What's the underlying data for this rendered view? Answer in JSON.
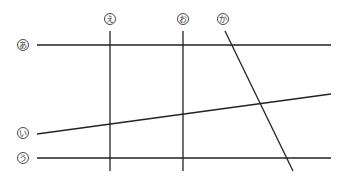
{
  "diagram": {
    "type": "line-intersection",
    "colors": {
      "line": "#222222",
      "label": "#333333",
      "background": "#ffffff"
    },
    "lines": [
      {
        "id": "a",
        "label": "あ",
        "orientation": "horizontal",
        "x1": 37,
        "y1": 45,
        "x2": 331,
        "y2": 45,
        "label_x": 23,
        "label_y": 45
      },
      {
        "id": "i",
        "label": "い",
        "orientation": "slanted",
        "x1": 37,
        "y1": 134,
        "x2": 331,
        "y2": 94,
        "label_x": 23,
        "label_y": 133
      },
      {
        "id": "u",
        "label": "う",
        "orientation": "horizontal",
        "x1": 37,
        "y1": 158,
        "x2": 331,
        "y2": 158,
        "label_x": 23,
        "label_y": 158
      },
      {
        "id": "e",
        "label": "え",
        "orientation": "vertical",
        "x1": 110,
        "y1": 31,
        "x2": 110,
        "y2": 171,
        "label_x": 110,
        "label_y": 19
      },
      {
        "id": "o",
        "label": "お",
        "orientation": "vertical",
        "x1": 183,
        "y1": 31,
        "x2": 183,
        "y2": 171,
        "label_x": 183,
        "label_y": 19
      },
      {
        "id": "ka",
        "label": "か",
        "orientation": "slanted",
        "x1": 225,
        "y1": 31,
        "x2": 293,
        "y2": 171,
        "label_x": 223,
        "label_y": 19
      }
    ]
  }
}
